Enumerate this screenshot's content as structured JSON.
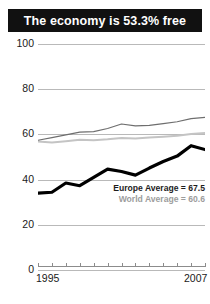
{
  "title": "The economy is 53.3% free",
  "legend": {
    "europe": "Europe Average = 67.5",
    "world": "World Average = 60.6"
  },
  "colors": {
    "title_bg": "#111111",
    "title_fg": "#ffffff",
    "country_line": "#000000",
    "europe_line": "#6e6e6e",
    "world_line": "#c4c4c4",
    "gridline": "#b9b9b9",
    "axis": "#8c8c8c"
  },
  "chart_data": {
    "type": "line",
    "title": "The economy is 53.3% free",
    "xlabel": "",
    "ylabel": "",
    "ylim": [
      0,
      100
    ],
    "yticks": [
      0,
      20,
      40,
      60,
      80,
      100
    ],
    "ytick_labels": [
      "0",
      "20",
      "40",
      "60",
      "80",
      "100"
    ],
    "xlim": [
      1995,
      2007
    ],
    "x": [
      1995,
      1996,
      1997,
      1998,
      1999,
      2000,
      2001,
      2002,
      2003,
      2004,
      2005,
      2006,
      2007
    ],
    "xtick_labels": [
      "1995",
      "2007"
    ],
    "xtick_label_years": [
      1995,
      2007
    ],
    "grid": true,
    "legend_position": "inside-right",
    "series": [
      {
        "name": "Country",
        "color": "#000000",
        "width": 3.2,
        "values": [
          34.0,
          34.4,
          38.5,
          37.3,
          41.0,
          44.6,
          43.6,
          42.0,
          45.1,
          48.0,
          50.4,
          55.0,
          53.3
        ]
      },
      {
        "name": "Europe Average = 67.5",
        "color": "#6e6e6e",
        "width": 1.2,
        "values": [
          57.4,
          58.6,
          59.8,
          61.0,
          61.2,
          62.6,
          64.6,
          63.8,
          64.0,
          64.8,
          65.6,
          67.0,
          67.5
        ]
      },
      {
        "name": "World Average = 60.6",
        "color": "#c4c4c4",
        "width": 2.0,
        "values": [
          56.9,
          56.4,
          57.0,
          57.6,
          57.4,
          57.8,
          58.4,
          58.2,
          58.6,
          59.0,
          59.4,
          60.2,
          60.6
        ]
      }
    ]
  }
}
